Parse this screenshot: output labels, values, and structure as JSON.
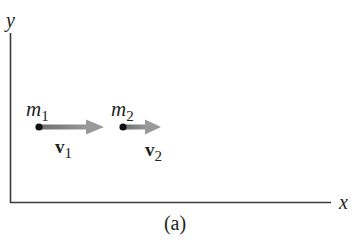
{
  "diagram": {
    "caption": "(a)",
    "axes": {
      "x_label": "x",
      "y_label": "y"
    },
    "masses": [
      {
        "name": "m",
        "subscript": "1",
        "velocity_name": "v",
        "velocity_subscript": "1"
      },
      {
        "name": "m",
        "subscript": "2",
        "velocity_name": "v",
        "velocity_subscript": "2"
      }
    ],
    "colors": {
      "axis": "#3a3a3a",
      "dot": "#111111",
      "arrow_dark": "#6e6e6e",
      "arrow_light": "#9a9a9a",
      "text": "#231f20"
    }
  }
}
